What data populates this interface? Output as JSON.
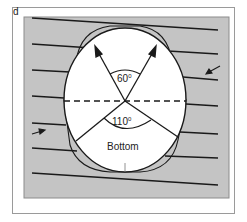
{
  "figure": {
    "panel_label": "d",
    "colors": {
      "background": "#ffffff",
      "frame": "#9a9a9a",
      "panel_fill": "#c4c4c4",
      "panel_edge": "#8c8c8c",
      "circle_fill": "#ffffff",
      "line": "#1a1a1a"
    },
    "angles": {
      "top_label": "60",
      "bottom_label": "110",
      "degree_symbol": "0"
    },
    "region_label": "Bottom",
    "annotations": {
      "left_arrow": "arrow-right",
      "right_arrow": "arrow-down-left",
      "dashed_line": "horizontal-midline"
    }
  }
}
